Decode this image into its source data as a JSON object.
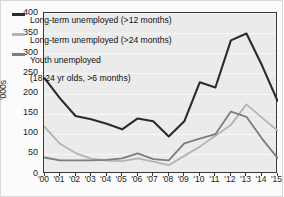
{
  "chart_data": {
    "type": "line",
    "title": "",
    "xlabel": "",
    "ylabel": "'000s",
    "categories": [
      "'00",
      "'01",
      "'02",
      "'03",
      "'04",
      "'05",
      "'06",
      "'07",
      "'08",
      "'09",
      "'10",
      "'11",
      "'12",
      "'13",
      "'14",
      "'15"
    ],
    "ylim": [
      0,
      400
    ],
    "yticks": [
      0,
      50,
      100,
      150,
      200,
      250,
      300,
      350,
      400
    ],
    "grid": true,
    "legend_position": "top-left",
    "series": [
      {
        "name": "Long-term unemployed (>12 months)",
        "color": "#2b2b2b",
        "values": [
          238,
          188,
          144,
          136,
          125,
          111,
          138,
          131,
          93,
          131,
          228,
          215,
          332,
          349,
          270,
          182
        ]
      },
      {
        "name": "Long-term unemployed (>24 months)",
        "color": "#b4b4b4",
        "values": [
          117,
          75,
          52,
          38,
          33,
          32,
          39,
          31,
          22,
          45,
          68,
          95,
          122,
          173,
          140,
          108
        ]
      },
      {
        "name": "Youth unemployed (18-24 yr olds, >6 months)",
        "color": "#7d7d7d",
        "values": [
          41,
          34,
          34,
          34,
          35,
          39,
          51,
          37,
          34,
          76,
          88,
          99,
          155,
          142,
          88,
          40
        ]
      }
    ]
  },
  "legend": {
    "items": [
      {
        "label": "Long-term unemployed (>12 months)",
        "sub": "",
        "color": "#2b2b2b"
      },
      {
        "label": "Long-term unemployed (>24 months)",
        "sub": "",
        "color": "#b4b4b4"
      },
      {
        "label": "Youth unemployed",
        "sub": "(18-24 yr olds,  >6 months)",
        "color": "#7d7d7d"
      }
    ]
  },
  "axes": {
    "y_title": "'000s",
    "y_ticks": [
      "400",
      "350",
      "300",
      "250",
      "200",
      "150",
      "100",
      "50",
      "0"
    ],
    "x_ticks": [
      "'00",
      "'01",
      "'02",
      "'03",
      "'04",
      "'05",
      "'06",
      "'07",
      "'08",
      "'09",
      "'10",
      "'11",
      "'12",
      "'13",
      "'14",
      "'15"
    ]
  }
}
